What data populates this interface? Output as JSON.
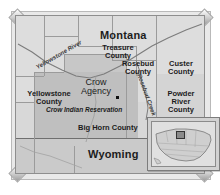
{
  "figure": {
    "kind": "reference-map",
    "region": "Crow Indian Reservation, southeastern Montana"
  },
  "map": {
    "states": [
      {
        "name": "Montana",
        "id": "montana"
      },
      {
        "name": "Wyoming",
        "id": "wyoming"
      }
    ],
    "counties": [
      {
        "name": "Treasure County",
        "line1": "Treasure",
        "line2": "County"
      },
      {
        "name": "Rosebud County",
        "line1": "Rosebud",
        "line2": "County"
      },
      {
        "name": "Custer County",
        "line1": "Custer",
        "line2": "County"
      },
      {
        "name": "Yellowstone County",
        "line1": "Yellowstone",
        "line2": "County"
      },
      {
        "name": "Powder River County",
        "line1": "Powder",
        "line2": "River",
        "line3": "County"
      },
      {
        "name": "Big Horn County",
        "line1": "Big Horn County"
      }
    ],
    "places": [
      {
        "name": "Crow Agency",
        "line1": "Crow",
        "line2": "Agency",
        "marker": "city-dot"
      }
    ],
    "areas": [
      {
        "name": "Crow Indian Reservation",
        "label": "Crow Indian Reservation"
      }
    ],
    "rivers": [
      {
        "name": "Yellowstone River",
        "label": "Yellowstone River"
      },
      {
        "name": "Rosebud Creek",
        "label": "Rosebud Creek"
      }
    ]
  },
  "inset": {
    "name": "United States locator map",
    "highlight": "Montana"
  },
  "colors": {
    "frame_fill": "#e9e9e9",
    "frame_border": "#8e8e8e",
    "land_light": "#dddddd",
    "land_mid": "#cacaca",
    "reservation_fill": "#bfbfbf",
    "boundary": "#9b9b9b",
    "text": "#1c1c1c",
    "river": "#6f6f6f"
  }
}
